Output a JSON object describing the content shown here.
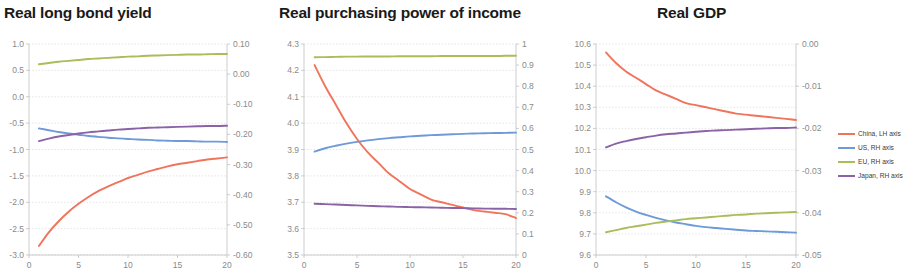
{
  "legend": {
    "position": "right",
    "entries": [
      {
        "label": "China, LH axis",
        "color": "#f0745c"
      },
      {
        "label": "US, RH axis",
        "color": "#6e9ad9"
      },
      {
        "label": "EU, RH axis",
        "color": "#a9bd5b"
      },
      {
        "label": "Japan, RH axis",
        "color": "#8a62a6"
      }
    ]
  },
  "chart_data": [
    {
      "type": "line",
      "title": "Real long bond yield",
      "xlabel": "",
      "ylabel": "",
      "xlim": [
        0,
        20
      ],
      "xticks": [
        0,
        5,
        10,
        15,
        20
      ],
      "xtick_labels": [
        "0",
        "5",
        "10",
        "15",
        "20"
      ],
      "grid": true,
      "left_axis": {
        "name": "LH axis",
        "ylim": [
          -3.0,
          1.0
        ],
        "yticks": [
          1.0,
          0.5,
          0.0,
          -0.5,
          -1.0,
          -1.5,
          -2.0,
          -2.5,
          -3.0
        ],
        "ytick_labels": [
          "1.0",
          "0.5",
          "0.0",
          "-0.5",
          "-1.0",
          "-1.5",
          "-2.0",
          "-2.5",
          "-3.0"
        ]
      },
      "right_axis": {
        "name": "RH axis",
        "ylim": [
          -0.6,
          0.1
        ],
        "yticks": [
          0.1,
          0.0,
          -0.1,
          -0.2,
          -0.3,
          -0.4,
          -0.5,
          -0.6
        ],
        "ytick_labels": [
          "0.10",
          "0.00",
          "-0.10",
          "-0.20",
          "-0.30",
          "-0.40",
          "-0.50",
          "-0.60"
        ]
      },
      "x": [
        1,
        2,
        3,
        4,
        5,
        6,
        7,
        8,
        9,
        10,
        11,
        12,
        13,
        14,
        15,
        16,
        17,
        18,
        19,
        20
      ],
      "series": [
        {
          "name": "China, LH axis",
          "axis": "left",
          "color": "#f0745c",
          "values": [
            -2.83,
            -2.57,
            -2.36,
            -2.18,
            -2.03,
            -1.9,
            -1.79,
            -1.7,
            -1.62,
            -1.54,
            -1.48,
            -1.42,
            -1.37,
            -1.32,
            -1.28,
            -1.25,
            -1.22,
            -1.19,
            -1.17,
            -1.15
          ]
        },
        {
          "name": "US, RH axis",
          "axis": "right",
          "color": "#6e9ad9",
          "values": [
            -0.18,
            -0.186,
            -0.192,
            -0.197,
            -0.201,
            -0.205,
            -0.208,
            -0.211,
            -0.213,
            -0.215,
            -0.217,
            -0.218,
            -0.22,
            -0.221,
            -0.222,
            -0.222,
            -0.223,
            -0.224,
            -0.224,
            -0.225
          ]
        },
        {
          "name": "EU, RH axis",
          "axis": "right",
          "color": "#a9bd5b",
          "values": [
            0.033,
            0.037,
            0.041,
            0.044,
            0.047,
            0.05,
            0.052,
            0.054,
            0.056,
            0.058,
            0.059,
            0.061,
            0.062,
            0.063,
            0.064,
            0.065,
            0.065,
            0.066,
            0.067,
            0.067
          ]
        },
        {
          "name": "Japan, RH axis",
          "axis": "right",
          "color": "#8a62a6",
          "values": [
            -0.222,
            -0.214,
            -0.207,
            -0.202,
            -0.197,
            -0.193,
            -0.19,
            -0.187,
            -0.184,
            -0.182,
            -0.18,
            -0.178,
            -0.177,
            -0.176,
            -0.175,
            -0.174,
            -0.173,
            -0.172,
            -0.172,
            -0.171
          ]
        }
      ]
    },
    {
      "type": "line",
      "title": "Real purchasing power of income",
      "xlabel": "",
      "ylabel": "",
      "xlim": [
        0,
        20
      ],
      "xticks": [
        0,
        5,
        10,
        15,
        20
      ],
      "xtick_labels": [
        "0",
        "5",
        "10",
        "15",
        "20"
      ],
      "grid": true,
      "left_axis": {
        "name": "LH axis",
        "ylim": [
          3.5,
          4.3
        ],
        "yticks": [
          4.3,
          4.2,
          4.1,
          4.0,
          3.9,
          3.8,
          3.7,
          3.6,
          3.5
        ],
        "ytick_labels": [
          "4.3",
          "4.2",
          "4.1",
          "4.0",
          "3.9",
          "3.8",
          "3.7",
          "3.6",
          "3.5"
        ]
      },
      "right_axis": {
        "name": "RH axis",
        "ylim": [
          0,
          1
        ],
        "yticks": [
          1,
          0.9,
          0.8,
          0.7,
          0.6,
          0.5,
          0.4,
          0.3,
          0.2,
          0.1,
          0
        ],
        "ytick_labels": [
          "1",
          "0.9",
          "0.8",
          "0.7",
          "0.6",
          "0.5",
          "0.4",
          "0.3",
          "0.2",
          "0.1",
          "0"
        ]
      },
      "x": [
        1,
        2,
        3,
        4,
        5,
        6,
        7,
        8,
        9,
        10,
        11,
        12,
        13,
        14,
        15,
        16,
        17,
        18,
        19,
        20
      ],
      "series": [
        {
          "name": "China, LH axis",
          "axis": "left",
          "color": "#f0745c",
          "values": [
            4.22,
            4.14,
            4.07,
            4.0,
            3.94,
            3.89,
            3.85,
            3.81,
            3.78,
            3.75,
            3.73,
            3.71,
            3.7,
            3.69,
            3.68,
            3.67,
            3.665,
            3.66,
            3.655,
            3.64
          ]
        },
        {
          "name": "US, RH axis",
          "axis": "right",
          "color": "#6e9ad9",
          "values": [
            0.49,
            0.506,
            0.518,
            0.528,
            0.536,
            0.543,
            0.549,
            0.554,
            0.558,
            0.562,
            0.565,
            0.568,
            0.57,
            0.572,
            0.574,
            0.576,
            0.577,
            0.578,
            0.579,
            0.58
          ]
        },
        {
          "name": "EU, RH axis",
          "axis": "right",
          "color": "#a9bd5b",
          "values": [
            0.937,
            0.938,
            0.939,
            0.94,
            0.94,
            0.941,
            0.941,
            0.941,
            0.942,
            0.942,
            0.942,
            0.942,
            0.943,
            0.943,
            0.943,
            0.943,
            0.943,
            0.943,
            0.944,
            0.944
          ]
        },
        {
          "name": "Japan, RH axis",
          "axis": "right",
          "color": "#8a62a6",
          "values": [
            0.243,
            0.241,
            0.239,
            0.237,
            0.235,
            0.233,
            0.231,
            0.23,
            0.228,
            0.227,
            0.226,
            0.225,
            0.224,
            0.223,
            0.222,
            0.221,
            0.22,
            0.219,
            0.219,
            0.218
          ]
        }
      ]
    },
    {
      "type": "line",
      "title": "Real GDP",
      "xlabel": "",
      "ylabel": "",
      "xlim": [
        0,
        20
      ],
      "xticks": [
        0,
        5,
        10,
        15,
        20
      ],
      "xtick_labels": [
        "0",
        "5",
        "10",
        "15",
        "20"
      ],
      "grid": true,
      "left_axis": {
        "name": "LH axis",
        "ylim": [
          9.6,
          10.6
        ],
        "yticks": [
          10.6,
          10.5,
          10.4,
          10.3,
          10.2,
          10.1,
          10.0,
          9.9,
          9.8,
          9.7,
          9.6
        ],
        "ytick_labels": [
          "10.6",
          "10.5",
          "10.4",
          "10.3",
          "10.2",
          "10.1",
          "10.0",
          "9.9",
          "9.8",
          "9.7",
          "9.6"
        ]
      },
      "right_axis": {
        "name": "RH axis",
        "ylim": [
          -0.05,
          0.0
        ],
        "yticks": [
          0.0,
          -0.01,
          -0.02,
          -0.03,
          -0.04,
          -0.05
        ],
        "ytick_labels": [
          "0.00",
          "-0.01",
          "-0.02",
          "-0.03",
          "-0.04",
          "-0.05"
        ]
      },
      "x": [
        1,
        2,
        3,
        4,
        5,
        6,
        7,
        8,
        9,
        10,
        11,
        12,
        13,
        14,
        15,
        16,
        17,
        18,
        19,
        20
      ],
      "series": [
        {
          "name": "China, LH axis",
          "axis": "left",
          "color": "#f0745c",
          "values": [
            10.56,
            10.51,
            10.47,
            10.44,
            10.41,
            10.38,
            10.36,
            10.34,
            10.32,
            10.31,
            10.3,
            10.29,
            10.28,
            10.27,
            10.265,
            10.26,
            10.255,
            10.25,
            10.245,
            10.24
          ]
        },
        {
          "name": "US, RH axis",
          "axis": "right",
          "color": "#6e9ad9",
          "values": [
            -0.0361,
            -0.0375,
            -0.0387,
            -0.0397,
            -0.0405,
            -0.0412,
            -0.0418,
            -0.0423,
            -0.0427,
            -0.0431,
            -0.0434,
            -0.0436,
            -0.0438,
            -0.044,
            -0.0442,
            -0.0443,
            -0.0444,
            -0.0445,
            -0.0446,
            -0.0447
          ]
        },
        {
          "name": "EU, RH axis",
          "axis": "right",
          "color": "#a9bd5b",
          "values": [
            -0.0446,
            -0.0441,
            -0.0436,
            -0.0432,
            -0.0428,
            -0.0424,
            -0.0421,
            -0.0418,
            -0.0415,
            -0.0413,
            -0.0411,
            -0.0409,
            -0.0407,
            -0.0405,
            -0.0404,
            -0.0402,
            -0.0401,
            -0.04,
            -0.0399,
            -0.0398
          ]
        },
        {
          "name": "Japan, RH axis",
          "axis": "right",
          "color": "#8a62a6",
          "values": [
            -0.0245,
            -0.0236,
            -0.023,
            -0.0225,
            -0.0221,
            -0.0217,
            -0.0214,
            -0.0212,
            -0.021,
            -0.0208,
            -0.0206,
            -0.0205,
            -0.0204,
            -0.0203,
            -0.0202,
            -0.0201,
            -0.02,
            -0.0199,
            -0.0199,
            -0.0198
          ]
        }
      ]
    }
  ]
}
